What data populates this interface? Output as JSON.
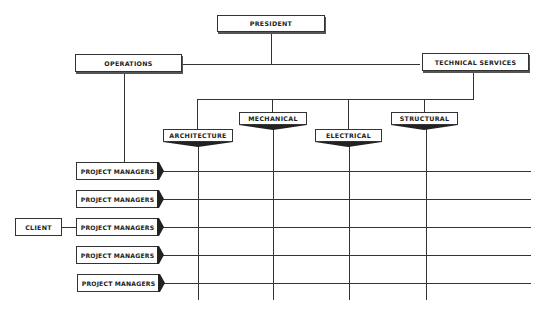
{
  "chart": {
    "top": {
      "president": "PRESIDENT"
    },
    "second_level": {
      "operations": "OPERATIONS",
      "technical_services": "TECHNICAL SERVICES"
    },
    "departments": [
      "ARCHITECTURE",
      "MECHANICAL",
      "ELECTRICAL",
      "STRUCTURAL"
    ],
    "project_managers": [
      "PROJECT MANAGERS",
      "PROJECT MANAGERS",
      "PROJECT MANAGERS",
      "PROJECT MANAGERS",
      "PROJECT MANAGERS"
    ],
    "client": "CLIENT"
  }
}
